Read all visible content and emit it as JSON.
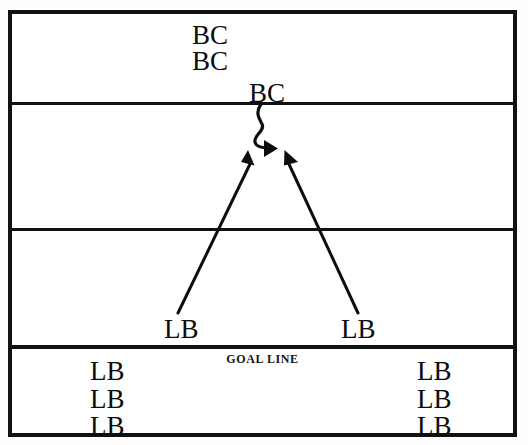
{
  "diagram": {
    "field": {
      "background_color": "#ffffff",
      "line_color": "#111111",
      "border_width_px": 4
    },
    "zones": [
      {
        "name": "end-zone-top",
        "label": ""
      },
      {
        "name": "mid-zone-upper",
        "label": ""
      },
      {
        "name": "mid-zone-lower",
        "label": ""
      },
      {
        "name": "end-zone-bottom",
        "label": ""
      }
    ],
    "yard_lines": [
      {
        "name": "yard-line-1",
        "y": 88
      },
      {
        "name": "yard-line-2",
        "y": 214
      },
      {
        "name": "goal-line",
        "y": 331
      }
    ],
    "goal_line_caption": "GOAL LINE",
    "players": {
      "ball_carriers": [
        {
          "id": "bc-1",
          "label": "BC"
        },
        {
          "id": "bc-2",
          "label": "BC"
        },
        {
          "id": "bc-3",
          "label": "BC"
        }
      ],
      "linebackers_mid": [
        {
          "id": "lb-mid-left",
          "label": "LB"
        },
        {
          "id": "lb-mid-right",
          "label": "LB"
        }
      ],
      "linebackers_bottom_left": [
        {
          "id": "lb-bl-1",
          "label": "LB"
        },
        {
          "id": "lb-bl-2",
          "label": "LB"
        },
        {
          "id": "lb-bl-3",
          "label": "LB"
        }
      ],
      "linebackers_bottom_right": [
        {
          "id": "lb-br-1",
          "label": "LB"
        },
        {
          "id": "lb-br-2",
          "label": "LB"
        },
        {
          "id": "lb-br-3",
          "label": "LB"
        }
      ]
    },
    "arrows": [
      {
        "name": "ball-carrier-path",
        "style": "squiggle",
        "description": "curved wavy path running downfield from BC"
      },
      {
        "name": "linebacker-pursuit-left",
        "style": "straight",
        "description": "straight pursuit arrow from left LB toward ball carrier"
      },
      {
        "name": "linebacker-pursuit-right",
        "style": "straight",
        "description": "straight pursuit arrow from right LB toward ball carrier"
      }
    ]
  }
}
